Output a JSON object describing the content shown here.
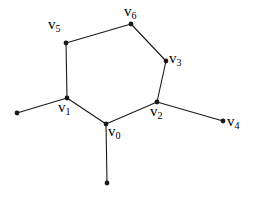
{
  "figure": {
    "background_color": "#ffffff",
    "stroke_color": "#1a1a1a",
    "text_color": "#000000",
    "width": 259,
    "height": 198
  },
  "nodes": [
    {
      "id": "v0",
      "label_base": "v",
      "label_sub": "0",
      "label_full": "v0",
      "x": 106,
      "y": 124,
      "label_x": 108,
      "label_y": 124,
      "kind": "labeled-vertex"
    },
    {
      "id": "v1",
      "label_base": "v",
      "label_sub": "1",
      "label_full": "v1",
      "x": 67,
      "y": 98,
      "label_x": 58,
      "label_y": 100,
      "kind": "labeled-vertex"
    },
    {
      "id": "v2",
      "label_base": "v",
      "label_sub": "2",
      "label_full": "v2",
      "x": 157,
      "y": 102,
      "label_x": 150,
      "label_y": 104,
      "kind": "labeled-vertex"
    },
    {
      "id": "v3",
      "label_base": "v",
      "label_sub": "3",
      "label_full": "v3",
      "x": 166,
      "y": 61,
      "label_x": 169,
      "label_y": 51,
      "kind": "labeled-vertex"
    },
    {
      "id": "v4",
      "label_base": "v",
      "label_sub": "4",
      "label_full": "v4",
      "x": 223,
      "y": 121,
      "label_x": 227,
      "label_y": 114,
      "kind": "labeled-vertex"
    },
    {
      "id": "v5",
      "label_base": "v",
      "label_sub": "5",
      "label_full": "v5",
      "x": 66,
      "y": 43,
      "label_x": 48,
      "label_y": 17,
      "kind": "labeled-vertex"
    },
    {
      "id": "v6",
      "label_base": "v",
      "label_sub": "6",
      "label_full": "v6",
      "x": 131,
      "y": 24,
      "label_x": 124,
      "label_y": 4,
      "kind": "labeled-vertex"
    },
    {
      "id": "e_left",
      "label_base": "",
      "label_sub": "",
      "label_full": "",
      "x": 17,
      "y": 113,
      "label_x": 0,
      "label_y": 0,
      "kind": "unlabeled-endpoint"
    },
    {
      "id": "e_bottom",
      "label_base": "",
      "label_sub": "",
      "label_full": "",
      "x": 107,
      "y": 183,
      "label_x": 0,
      "label_y": 0,
      "kind": "unlabeled-endpoint"
    }
  ],
  "edges": [
    {
      "from": "v5",
      "to": "v6"
    },
    {
      "from": "v6",
      "to": "v3"
    },
    {
      "from": "v3",
      "to": "v2"
    },
    {
      "from": "v2",
      "to": "v0"
    },
    {
      "from": "v0",
      "to": "v1"
    },
    {
      "from": "v1",
      "to": "v5"
    },
    {
      "from": "v1",
      "to": "e_left"
    },
    {
      "from": "v2",
      "to": "v4"
    },
    {
      "from": "v0",
      "to": "e_bottom"
    }
  ],
  "style": {
    "edge_width": 1.1,
    "dot_radius": 2.4
  }
}
